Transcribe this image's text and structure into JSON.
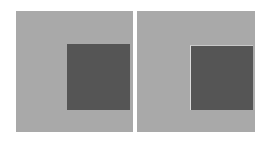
{
  "figure": {
    "background": "#ffffff",
    "panels": [
      {
        "name": "left",
        "outer": {
          "x": 16,
          "y": 11,
          "w": 117,
          "h": 121,
          "color": "#a9a9a9"
        },
        "inner": {
          "x": 67,
          "y": 44,
          "w": 63,
          "h": 66,
          "color": "#555555",
          "edge": "none"
        }
      },
      {
        "name": "right",
        "outer": {
          "x": 137,
          "y": 11,
          "w": 118,
          "h": 121,
          "color": "#a9a9a9"
        },
        "inner": {
          "x": 190,
          "y": 45,
          "w": 63,
          "h": 65,
          "color": "#555555",
          "edge": "#dcdcdc"
        }
      }
    ]
  }
}
